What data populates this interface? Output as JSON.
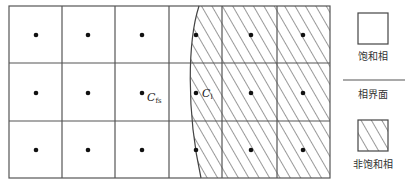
{
  "diagram": {
    "grid": {
      "rows": 3,
      "cols": 6,
      "x_lines": [
        9,
        62,
        115,
        169,
        222,
        277,
        330
      ],
      "y_lines": [
        6,
        63,
        121,
        178
      ],
      "line_color": "#555555"
    },
    "interface_curve": "M 199 6 C 188 40 186 110 201 178",
    "node_labels": {
      "saturated_node": "C",
      "saturated_node_sub": "fs",
      "unsaturated_node": "C",
      "unsaturated_node_sub": "l"
    },
    "legend": {
      "saturated_phase": "饱和相",
      "phase_interface": "相界面",
      "unsaturated_phase": "非饱和相"
    },
    "colors": {
      "line": "#555555",
      "dot": "#111111",
      "hatch": "#333333",
      "background": "#ffffff"
    }
  }
}
